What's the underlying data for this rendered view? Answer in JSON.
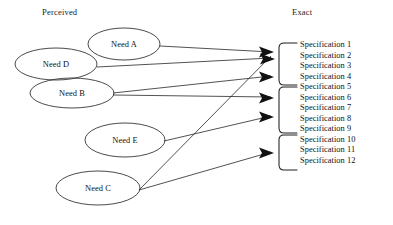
{
  "figure": {
    "type": "mapping-diagram",
    "columns": {
      "left_label": "Perceived",
      "right_label": "Exact"
    },
    "colors": {
      "stroke": "#262626",
      "text": "#111111",
      "background": "#ffffff"
    }
  },
  "needs": [
    {
      "id": "need-a",
      "label": "Need A",
      "cx": 124,
      "cy": 44,
      "rx": 36,
      "ry": 16
    },
    {
      "id": "need-d",
      "label": "Need D",
      "cx": 56,
      "cy": 64,
      "rx": 41,
      "ry": 16
    },
    {
      "id": "need-b",
      "label": "Need B",
      "cx": 72,
      "cy": 93,
      "rx": 42,
      "ry": 15
    },
    {
      "id": "need-e",
      "label": "Need E",
      "cx": 125,
      "cy": 140,
      "rx": 40,
      "ry": 17
    },
    {
      "id": "need-c",
      "label": "Need C",
      "cx": 98,
      "cy": 188,
      "rx": 42,
      "ry": 17
    }
  ],
  "specifications": [
    "Specification 1",
    "Specification 2",
    "Specification 3",
    "Specification 4",
    "Specification 5",
    "Specification 6",
    "Specification 7",
    "Specification 8",
    "Specification 9",
    "Specification 10",
    "Specification 11",
    "Specification 12"
  ],
  "groups": [
    {
      "id": "group-1",
      "members": [
        1,
        2,
        3,
        4
      ],
      "top": 43,
      "bottom": 85
    },
    {
      "id": "group-2",
      "members": [
        5,
        6,
        7,
        8,
        9
      ],
      "top": 87,
      "bottom": 133
    },
    {
      "id": "group-3",
      "members": [
        10,
        11,
        12
      ],
      "top": 135,
      "bottom": 170
    }
  ],
  "edges": [
    {
      "id": "edge-need-a-1",
      "from": "need-a",
      "to": "arrow-1",
      "x1": 160,
      "y1": 46,
      "x2": 274,
      "y2": 52
    },
    {
      "id": "edge-need-d-1",
      "from": "need-d",
      "to": "arrow-2",
      "x1": 97,
      "y1": 67,
      "x2": 274,
      "y2": 58
    },
    {
      "id": "edge-need-b-1",
      "from": "need-b",
      "to": "arrow-3",
      "x1": 113,
      "y1": 94,
      "x2": 274,
      "y2": 76
    },
    {
      "id": "edge-need-b-2",
      "from": "need-b",
      "to": "arrow-4",
      "x1": 113,
      "y1": 95,
      "x2": 274,
      "y2": 97
    },
    {
      "id": "edge-need-e-1",
      "from": "need-e",
      "to": "arrow-5",
      "x1": 164,
      "y1": 141,
      "x2": 274,
      "y2": 116
    },
    {
      "id": "edge-need-c-1",
      "from": "need-c",
      "to": "arrow-2b",
      "x1": 139,
      "y1": 190,
      "x2": 274,
      "y2": 56
    },
    {
      "id": "edge-need-c-2",
      "from": "need-c",
      "to": "arrow-6",
      "x1": 139,
      "y1": 190,
      "x2": 274,
      "y2": 152
    }
  ],
  "arrows": [
    {
      "id": "arrow-1",
      "x": 274,
      "y": 52
    },
    {
      "id": "arrow-2",
      "x": 274,
      "y": 58
    },
    {
      "id": "arrow-3",
      "x": 274,
      "y": 76
    },
    {
      "id": "arrow-4",
      "x": 274,
      "y": 97
    },
    {
      "id": "arrow-5",
      "x": 274,
      "y": 116
    },
    {
      "id": "arrow-6",
      "x": 274,
      "y": 152
    }
  ]
}
